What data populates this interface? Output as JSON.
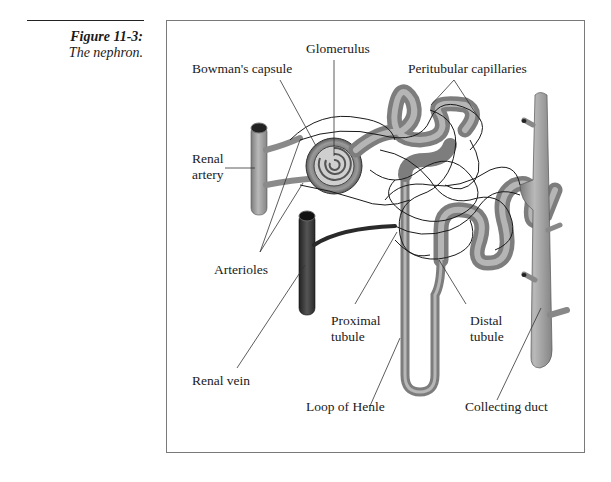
{
  "figure": {
    "number": "Figure 11-3:",
    "title": "The nephron."
  },
  "labels": {
    "glomerulus": "Glomerulus",
    "bowmans_capsule": "Bowman's capsule",
    "peritubular_capillaries": "Peritubular capillaries",
    "renal_artery_line1": "Renal",
    "renal_artery_line2": "artery",
    "arterioles": "Arterioles",
    "proximal_tubule_line1": "Proximal",
    "proximal_tubule_line2": "tubule",
    "distal_tubule_line1": "Distal",
    "distal_tubule_line2": "tubule",
    "renal_vein": "Renal vein",
    "loop_of_henle": "Loop of Henle",
    "collecting_duct": "Collecting duct"
  },
  "colors": {
    "tubule": "#8e8e8e",
    "tubule_highlight": "#bdbdbd",
    "artery": "#7d7d7d",
    "vein": "#3a3a3a",
    "capillary": "#1a1a1a",
    "frame": "#7a7a7a"
  }
}
